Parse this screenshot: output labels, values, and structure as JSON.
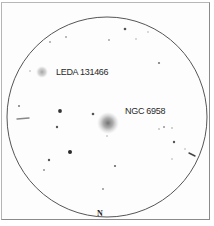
{
  "diagram": {
    "type": "finder-chart",
    "field_circle": {
      "cx": 107,
      "cy": 117,
      "r": 100,
      "stroke": "#555555"
    },
    "orientation_label": "N",
    "objects": [
      {
        "name": "LEDA 131466",
        "x": 42,
        "y": 72,
        "r": 6,
        "label_x": 56,
        "label_y": 67
      },
      {
        "name": "NGC 6958",
        "x": 108,
        "y": 123,
        "r": 11,
        "label_x": 125,
        "label_y": 106
      }
    ],
    "stars": [
      {
        "x": 50,
        "y": 42,
        "r": 0.9,
        "color": "#9a9a9a"
      },
      {
        "x": 66,
        "y": 37,
        "r": 0.9,
        "color": "#9a9a9a"
      },
      {
        "x": 109,
        "y": 40,
        "r": 0.9,
        "color": "#9a9a9a"
      },
      {
        "x": 125,
        "y": 29,
        "r": 1.3,
        "color": "#555555"
      },
      {
        "x": 136,
        "y": 39,
        "r": 0.8,
        "color": "#aaaaaa"
      },
      {
        "x": 148,
        "y": 32,
        "r": 0.8,
        "color": "#aaaaaa"
      },
      {
        "x": 159,
        "y": 63,
        "r": 1.1,
        "color": "#777777"
      },
      {
        "x": 30,
        "y": 71,
        "r": 0.8,
        "color": "#aaaaaa"
      },
      {
        "x": 19,
        "y": 106,
        "r": 1.0,
        "color": "#777777"
      },
      {
        "x": 60,
        "y": 111,
        "r": 1.9,
        "color": "#333333"
      },
      {
        "x": 93,
        "y": 114,
        "r": 1.3,
        "color": "#555555"
      },
      {
        "x": 57,
        "y": 127,
        "r": 1.2,
        "color": "#555555"
      },
      {
        "x": 107,
        "y": 136,
        "r": 0.8,
        "color": "#aaaaaa"
      },
      {
        "x": 70,
        "y": 152,
        "r": 2.0,
        "color": "#2a2a2a"
      },
      {
        "x": 49,
        "y": 160,
        "r": 1.2,
        "color": "#555555"
      },
      {
        "x": 44,
        "y": 170,
        "r": 0.9,
        "color": "#888888"
      },
      {
        "x": 115,
        "y": 166,
        "r": 1.1,
        "color": "#666666"
      },
      {
        "x": 103,
        "y": 189,
        "r": 0.9,
        "color": "#888888"
      },
      {
        "x": 159,
        "y": 129,
        "r": 0.8,
        "color": "#999999"
      },
      {
        "x": 164,
        "y": 127,
        "r": 0.9,
        "color": "#888888"
      },
      {
        "x": 172,
        "y": 128,
        "r": 0.8,
        "color": "#999999"
      },
      {
        "x": 174,
        "y": 142,
        "r": 1.2,
        "color": "#555555"
      },
      {
        "x": 185,
        "y": 149,
        "r": 0.8,
        "color": "#aaaaaa"
      },
      {
        "x": 172,
        "y": 159,
        "r": 0.8,
        "color": "#aaaaaa"
      }
    ],
    "streaks": [
      {
        "x1": 17,
        "y1": 119,
        "x2": 29,
        "y2": 118,
        "color": "#888888"
      },
      {
        "x1": 189,
        "y1": 153,
        "x2": 195,
        "y2": 156,
        "color": "#444444"
      }
    ]
  }
}
